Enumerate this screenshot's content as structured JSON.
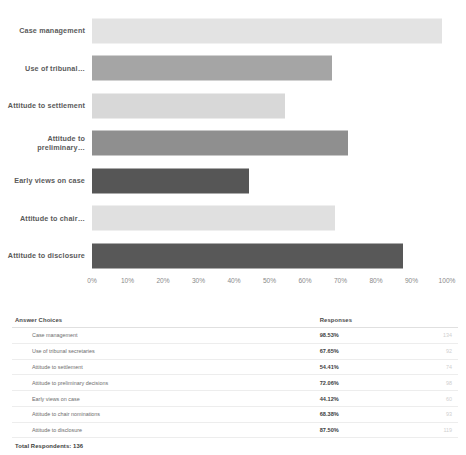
{
  "chart_data": {
    "type": "bar",
    "orientation": "horizontal",
    "title": "",
    "xlabel": "",
    "ylabel": "",
    "xlim": [
      0,
      100
    ],
    "grid": false,
    "legend": false,
    "categories": [
      "Case management",
      "Use of tribunal…",
      "Attitude to settlement",
      "Attitude to preliminary…",
      "Early views on case",
      "Attitude to chair…",
      "Attitude to disclosure"
    ],
    "values": [
      98.53,
      67.65,
      54.41,
      72.06,
      44.12,
      68.38,
      87.5
    ],
    "counts": [
      134,
      92,
      74,
      98,
      60,
      93,
      119
    ],
    "bar_colors": [
      "#e3e3e3",
      "#a5a5a5",
      "#d8d8d8",
      "#8f8f8f",
      "#565656",
      "#e0e0e0",
      "#585858"
    ],
    "tick_labels": [
      "0%",
      "10%",
      "20%",
      "30%",
      "40%",
      "50%",
      "60%",
      "70%",
      "80%",
      "90%",
      "100%"
    ],
    "tick_values": [
      0,
      10,
      20,
      30,
      40,
      50,
      60,
      70,
      80,
      90,
      100
    ]
  },
  "table": {
    "headers": {
      "choices": "Answer Choices",
      "responses": "Responses",
      "counts": ""
    },
    "rows": [
      {
        "choice": "Case management",
        "percent": "98.53%",
        "count": "134"
      },
      {
        "choice": "Use of tribunal secretaries",
        "percent": "67.65%",
        "count": "92"
      },
      {
        "choice": "Attitude to settlement",
        "percent": "54.41%",
        "count": "74"
      },
      {
        "choice": "Attitude to preliminary decisions",
        "percent": "72.06%",
        "count": "98"
      },
      {
        "choice": "Early views on case",
        "percent": "44.12%",
        "count": "60"
      },
      {
        "choice": "Attitude to chair nominations",
        "percent": "68.38%",
        "count": "93"
      },
      {
        "choice": "Attitude to disclosure",
        "percent": "87.50%",
        "count": "119"
      }
    ],
    "total_label": "Total Respondents: 136"
  }
}
